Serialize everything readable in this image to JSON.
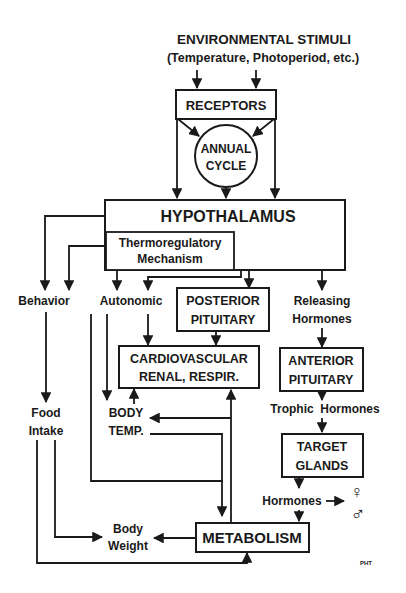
{
  "diagram": {
    "title": {
      "line1": "ENVIRONMENTAL STIMULI",
      "line2": "(Temperature, Photoperiod, etc.)"
    },
    "nodes": {
      "receptors": "RECEPTORS",
      "annual_cycle": {
        "line1": "ANNUAL",
        "line2": "CYCLE"
      },
      "hypothalamus": "HYPOTHALAMUS",
      "thermoregulatory": {
        "line1": "Thermoregulatory",
        "line2": "Mechanism"
      },
      "behavior": "Behavior",
      "autonomic": "Autonomic",
      "posterior_pituitary": {
        "line1": "POSTERIOR",
        "line2": "PITUITARY"
      },
      "releasing_hormones": {
        "line1": "Releasing",
        "line2": "Hormones"
      },
      "cardiovascular": {
        "line1": "CARDIOVASCULAR",
        "line2": "RENAL, RESPIR."
      },
      "anterior_pituitary": {
        "line1": "ANTERIOR",
        "line2": "PITUITARY"
      },
      "food_intake": {
        "line1": "Food",
        "line2": "Intake"
      },
      "body_temp": {
        "line1": "BODY",
        "line2": "TEMP."
      },
      "trophic_hormones": "Trophic  Hormones",
      "target_glands": {
        "line1": "TARGET",
        "line2": "GLANDS"
      },
      "hormones": "Hormones",
      "sex_symbols": {
        "female": "♀",
        "male": "♂"
      },
      "body_weight": {
        "line1": "Body",
        "line2": "Weight"
      },
      "metabolism": "METABOLISM"
    },
    "signature": "PHT",
    "colors": {
      "ink": "#1a1a1a",
      "background": "#ffffff"
    }
  }
}
